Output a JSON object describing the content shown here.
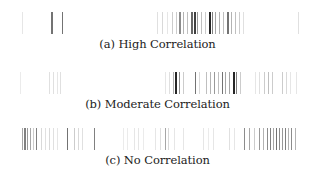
{
  "figure": {
    "panels": [
      {
        "id": "a",
        "caption": "(a) High Correlation"
      },
      {
        "id": "b",
        "caption": "(b) Moderate Correlation"
      },
      {
        "id": "c",
        "caption": "(c) No Correlation"
      }
    ]
  },
  "chart_data": [
    {
      "type": "heatmap",
      "title": "(a) High Correlation",
      "xlabel": "",
      "ylabel": "",
      "grid": false,
      "description": "1D barcode strip; each bar at x position (px) with width and gray intensity (0=white,1=black)",
      "bars": [
        {
          "x": 22,
          "w": 1,
          "v": 0.1
        },
        {
          "x": 51,
          "w": 2,
          "v": 0.55
        },
        {
          "x": 62,
          "w": 1,
          "v": 0.55
        },
        {
          "x": 157,
          "w": 1,
          "v": 0.12
        },
        {
          "x": 162,
          "w": 1,
          "v": 0.15
        },
        {
          "x": 167,
          "w": 1,
          "v": 0.1
        },
        {
          "x": 172,
          "w": 1,
          "v": 0.2
        },
        {
          "x": 176,
          "w": 1,
          "v": 0.2
        },
        {
          "x": 179,
          "w": 2,
          "v": 0.45
        },
        {
          "x": 183,
          "w": 1,
          "v": 0.3
        },
        {
          "x": 187,
          "w": 1,
          "v": 0.25
        },
        {
          "x": 191,
          "w": 2,
          "v": 0.6
        },
        {
          "x": 194,
          "w": 2,
          "v": 0.75
        },
        {
          "x": 197,
          "w": 1,
          "v": 0.4
        },
        {
          "x": 201,
          "w": 1,
          "v": 0.25
        },
        {
          "x": 205,
          "w": 1,
          "v": 0.2
        },
        {
          "x": 209,
          "w": 2,
          "v": 0.85
        },
        {
          "x": 212,
          "w": 1,
          "v": 0.5
        },
        {
          "x": 215,
          "w": 1,
          "v": 0.35
        },
        {
          "x": 219,
          "w": 1,
          "v": 0.3
        },
        {
          "x": 223,
          "w": 1,
          "v": 0.25
        },
        {
          "x": 227,
          "w": 2,
          "v": 0.55
        },
        {
          "x": 231,
          "w": 1,
          "v": 0.3
        },
        {
          "x": 235,
          "w": 1,
          "v": 0.25
        },
        {
          "x": 239,
          "w": 1,
          "v": 0.2
        },
        {
          "x": 243,
          "w": 1,
          "v": 0.12
        },
        {
          "x": 298,
          "w": 1,
          "v": 0.12
        }
      ]
    },
    {
      "type": "heatmap",
      "title": "(b) Moderate Correlation",
      "xlabel": "",
      "ylabel": "",
      "grid": false,
      "bars": [
        {
          "x": 20,
          "w": 1,
          "v": 0.08
        },
        {
          "x": 49,
          "w": 1,
          "v": 0.12
        },
        {
          "x": 53,
          "w": 1,
          "v": 0.12
        },
        {
          "x": 57,
          "w": 1,
          "v": 0.1
        },
        {
          "x": 60,
          "w": 1,
          "v": 0.12
        },
        {
          "x": 165,
          "w": 1,
          "v": 0.1
        },
        {
          "x": 169,
          "w": 1,
          "v": 0.12
        },
        {
          "x": 173,
          "w": 1,
          "v": 0.3
        },
        {
          "x": 175,
          "w": 2,
          "v": 0.85
        },
        {
          "x": 179,
          "w": 1,
          "v": 0.45
        },
        {
          "x": 183,
          "w": 1,
          "v": 0.2
        },
        {
          "x": 195,
          "w": 1,
          "v": 0.55
        },
        {
          "x": 199,
          "w": 1,
          "v": 0.15
        },
        {
          "x": 206,
          "w": 1,
          "v": 0.25
        },
        {
          "x": 210,
          "w": 1,
          "v": 0.3
        },
        {
          "x": 214,
          "w": 1,
          "v": 0.4
        },
        {
          "x": 218,
          "w": 1,
          "v": 0.25
        },
        {
          "x": 222,
          "w": 1,
          "v": 0.55
        },
        {
          "x": 225,
          "w": 1,
          "v": 0.35
        },
        {
          "x": 229,
          "w": 1,
          "v": 0.35
        },
        {
          "x": 233,
          "w": 2,
          "v": 0.85
        },
        {
          "x": 236,
          "w": 1,
          "v": 0.5
        },
        {
          "x": 240,
          "w": 1,
          "v": 0.2
        },
        {
          "x": 255,
          "w": 1,
          "v": 0.1
        },
        {
          "x": 259,
          "w": 1,
          "v": 0.12
        },
        {
          "x": 264,
          "w": 1,
          "v": 0.2
        },
        {
          "x": 268,
          "w": 1,
          "v": 0.25
        },
        {
          "x": 272,
          "w": 1,
          "v": 0.2
        },
        {
          "x": 282,
          "w": 1,
          "v": 0.2
        },
        {
          "x": 286,
          "w": 1,
          "v": 0.15
        },
        {
          "x": 290,
          "w": 1,
          "v": 0.1
        },
        {
          "x": 296,
          "w": 1,
          "v": 0.1
        }
      ]
    },
    {
      "type": "heatmap",
      "title": "(c) No Correlation",
      "xlabel": "",
      "ylabel": "",
      "grid": false,
      "bars": [
        {
          "x": 22,
          "w": 1,
          "v": 0.35
        },
        {
          "x": 24,
          "w": 2,
          "v": 0.5
        },
        {
          "x": 27,
          "w": 1,
          "v": 0.4
        },
        {
          "x": 30,
          "w": 1,
          "v": 0.35
        },
        {
          "x": 33,
          "w": 1,
          "v": 0.2
        },
        {
          "x": 36,
          "w": 1,
          "v": 0.5
        },
        {
          "x": 41,
          "w": 1,
          "v": 0.15
        },
        {
          "x": 45,
          "w": 1,
          "v": 0.12
        },
        {
          "x": 49,
          "w": 1,
          "v": 0.15
        },
        {
          "x": 53,
          "w": 1,
          "v": 0.12
        },
        {
          "x": 57,
          "w": 1,
          "v": 0.1
        },
        {
          "x": 67,
          "w": 1,
          "v": 0.55
        },
        {
          "x": 74,
          "w": 1,
          "v": 0.2
        },
        {
          "x": 78,
          "w": 1,
          "v": 0.15
        },
        {
          "x": 82,
          "w": 1,
          "v": 0.12
        },
        {
          "x": 94,
          "w": 1,
          "v": 0.5
        },
        {
          "x": 123,
          "w": 1,
          "v": 0.08
        },
        {
          "x": 127,
          "w": 1,
          "v": 0.08
        },
        {
          "x": 134,
          "w": 1,
          "v": 0.1
        },
        {
          "x": 138,
          "w": 1,
          "v": 0.1
        },
        {
          "x": 143,
          "w": 1,
          "v": 0.08
        },
        {
          "x": 155,
          "w": 1,
          "v": 0.1
        },
        {
          "x": 160,
          "w": 1,
          "v": 0.12
        },
        {
          "x": 165,
          "w": 1,
          "v": 0.35
        },
        {
          "x": 168,
          "w": 1,
          "v": 0.15
        },
        {
          "x": 174,
          "w": 1,
          "v": 0.1
        },
        {
          "x": 183,
          "w": 1,
          "v": 0.1
        },
        {
          "x": 203,
          "w": 1,
          "v": 0.1
        },
        {
          "x": 208,
          "w": 1,
          "v": 0.08
        },
        {
          "x": 213,
          "w": 1,
          "v": 0.1
        },
        {
          "x": 229,
          "w": 1,
          "v": 0.12
        },
        {
          "x": 234,
          "w": 1,
          "v": 0.1
        },
        {
          "x": 244,
          "w": 1,
          "v": 0.45
        },
        {
          "x": 249,
          "w": 1,
          "v": 0.35
        },
        {
          "x": 254,
          "w": 1,
          "v": 0.2
        },
        {
          "x": 259,
          "w": 1,
          "v": 0.4
        },
        {
          "x": 263,
          "w": 1,
          "v": 0.3
        },
        {
          "x": 267,
          "w": 1,
          "v": 0.45
        },
        {
          "x": 270,
          "w": 1,
          "v": 0.5
        },
        {
          "x": 273,
          "w": 1,
          "v": 0.35
        },
        {
          "x": 276,
          "w": 1,
          "v": 0.55
        },
        {
          "x": 279,
          "w": 1,
          "v": 0.45
        },
        {
          "x": 282,
          "w": 1,
          "v": 0.4
        },
        {
          "x": 285,
          "w": 1,
          "v": 0.5
        },
        {
          "x": 288,
          "w": 1,
          "v": 0.3
        },
        {
          "x": 291,
          "w": 1,
          "v": 0.45
        },
        {
          "x": 295,
          "w": 1,
          "v": 0.3
        }
      ]
    }
  ]
}
